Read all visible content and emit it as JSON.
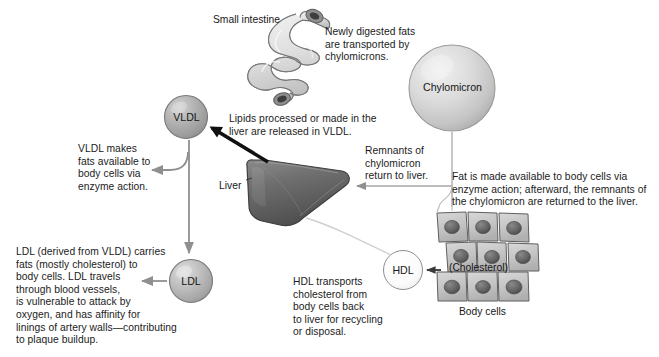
{
  "figure": {
    "type": "biology-flow-diagram",
    "topic": "Lipoprotein transport of fats and cholesterol",
    "background_color": "#ffffff",
    "text_color": "#1b1b1b"
  },
  "organs": [
    {
      "id": "small-intestine",
      "label": "Small intestine",
      "fill": "#dedede",
      "stroke": "#6e6e6e"
    },
    {
      "id": "liver",
      "label": "Liver",
      "fill": "#6f6f6f",
      "stroke": "#3c3c3c"
    },
    {
      "id": "body-cells",
      "label": "Body cells",
      "fill": "#c7c7c7",
      "stroke": "#5f5f5f",
      "nucleus_fill": "#656565",
      "rows": 3,
      "columns": 3,
      "inner_label": "(Cholesterol)"
    }
  ],
  "particles": [
    {
      "id": "chylomicron",
      "label": "Chylomicron",
      "fill": "#cfcfcf",
      "stroke": "#808080",
      "size": "large"
    },
    {
      "id": "vldl",
      "label": "VLDL",
      "fill": "#a8a8a8",
      "stroke": "#6b6b6b",
      "size": "small"
    },
    {
      "id": "ldl",
      "label": "LDL",
      "fill": "#b5b5b5",
      "stroke": "#6b6b6b",
      "size": "small"
    },
    {
      "id": "hdl",
      "label": "HDL",
      "fill": "#fbfbfb",
      "stroke": "#8a8a8a",
      "size": "small"
    }
  ],
  "annotations": {
    "newly_digested_fats": "Newly digested fats\nare transported by\nchylomicrons.",
    "lipids_processed": "Lipids processed or made in the\nliver are released in VLDL.",
    "vldl_makes_fats": "VLDL makes\nfats available to\nbody cells via\nenzyme action.",
    "ldl_description": "LDL (derived from VLDL) carries\nfats (mostly cholesterol) to\nbody cells. LDL travels\nthrough blood vessels,\nis vulnerable to attack by\noxygen, and has affinity for\nlinings of artery walls—contributing\nto plaque buildup.",
    "remnants_of_chylomicron": "Remnants of\nchylomicron\nreturn to liver.",
    "fat_made_available": "Fat is made available to body cells via\nenzyme action; afterward, the remnants of\nthe chylomicron are returned to the liver.",
    "hdl_transports": "HDL transports\ncholesterol from\nbody cells back\nto liver for recycling\nor disposal."
  },
  "flows": [
    {
      "id": "intestine-to-chylomicron",
      "from": "small-intestine",
      "to": "chylomicron",
      "style": "implied"
    },
    {
      "id": "chylomicron-to-body-cells",
      "from": "chylomicron",
      "to": "body-cells",
      "style": "thin-gray-line"
    },
    {
      "id": "body-cells-to-liver",
      "from": "body-cells",
      "to": "liver",
      "style": "gray-arrow"
    },
    {
      "id": "liver-to-vldl",
      "from": "liver",
      "to": "vldl",
      "style": "black-arrow"
    },
    {
      "id": "vldl-to-enzyme-text",
      "from": "vldl",
      "to": "vldl_makes_fats",
      "style": "gray-arrow"
    },
    {
      "id": "vldl-to-ldl",
      "from": "vldl",
      "to": "ldl",
      "style": "gray-arrow"
    },
    {
      "id": "ldl-to-text",
      "from": "ldl",
      "to": "ldl_description",
      "style": "gray-arrow"
    },
    {
      "id": "body-cells-to-hdl",
      "from": "body-cells",
      "to": "hdl",
      "style": "black-arrow"
    },
    {
      "id": "hdl-to-liver",
      "from": "hdl",
      "to": "liver",
      "style": "thin-gray-curve"
    }
  ],
  "cut_off_header": "",
  "icons": {
    "small_intestine": "intestine-icon",
    "liver": "liver-icon",
    "body_cells": "cell-grid-icon",
    "chylomicron": "sphere-icon"
  }
}
